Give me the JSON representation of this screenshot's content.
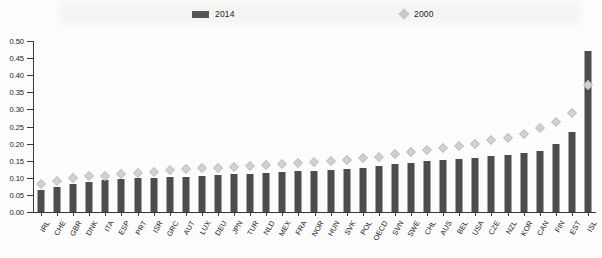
{
  "legend": {
    "series_2014_label": "2014",
    "series_2000_label": "2000",
    "bar_color": "#4d4d4d",
    "marker_color": "#d2d2d2"
  },
  "chart_data": {
    "type": "bar",
    "title": "",
    "subtitle": "",
    "xlabel": "",
    "ylabel": "",
    "ylim": [
      0.0,
      0.5
    ],
    "ytick_labels": [
      "0.00",
      "0.05",
      "0.10",
      "0.15",
      "0.20",
      "0.25",
      "0.30",
      "0.35",
      "0.40",
      "0.45",
      "0.50"
    ],
    "ytick_values": [
      0.0,
      0.05,
      0.1,
      0.15,
      0.2,
      0.25,
      0.3,
      0.35,
      0.4,
      0.45,
      0.5
    ],
    "grid": false,
    "legend_position": "top",
    "categories": [
      "IRL",
      "CHE",
      "GBR",
      "DNK",
      "ITA",
      "ESP",
      "PRT",
      "ISR",
      "GRC",
      "AUT",
      "LUX",
      "DEU",
      "JPN",
      "TUR",
      "NLD",
      "MEX",
      "FRA",
      "NOR",
      "HUN",
      "SVK",
      "POL",
      "OECD",
      "SVN",
      "SWE",
      "CHL",
      "AUS",
      "BEL",
      "USA",
      "CZE",
      "NZL",
      "KOR",
      "CAN",
      "FIN",
      "EST",
      "ISL"
    ],
    "series": [
      {
        "name": "2014",
        "type": "bar",
        "color": "#4d4d4d",
        "values": [
          0.065,
          0.072,
          0.082,
          0.088,
          0.094,
          0.096,
          0.098,
          0.1,
          0.101,
          0.103,
          0.105,
          0.107,
          0.11,
          0.112,
          0.115,
          0.117,
          0.119,
          0.12,
          0.122,
          0.125,
          0.13,
          0.135,
          0.14,
          0.143,
          0.148,
          0.152,
          0.155,
          0.158,
          0.165,
          0.168,
          0.172,
          0.178,
          0.2,
          0.235,
          0.47
        ]
      },
      {
        "name": "2000",
        "type": "scatter-marker",
        "color": "#d2d2d2",
        "values": [
          0.082,
          0.09,
          0.1,
          0.105,
          0.104,
          0.112,
          0.115,
          0.118,
          0.122,
          0.126,
          0.128,
          0.13,
          0.132,
          0.134,
          0.137,
          0.14,
          0.142,
          0.145,
          0.148,
          0.152,
          0.158,
          0.162,
          0.17,
          0.176,
          0.182,
          0.188,
          0.193,
          0.198,
          0.21,
          0.216,
          0.228,
          0.245,
          0.262,
          0.29,
          0.37
        ]
      }
    ]
  }
}
